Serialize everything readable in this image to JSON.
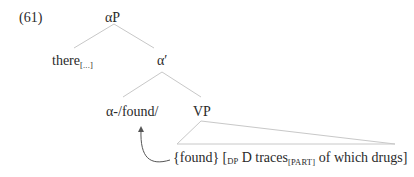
{
  "example_number": "(61)",
  "tree": {
    "root": "αP",
    "spec": {
      "word": "there",
      "subscript": "[...]"
    },
    "bar": "α′",
    "head": "α-/found/",
    "complement": "VP",
    "terminal": {
      "part1": "{found} [",
      "dp_label": "DP",
      "part2": " D traces",
      "traces_subscript": "[PART]",
      "part3": " of which drugs]"
    }
  },
  "colors": {
    "lines": "#c8c8c8",
    "text": "#2a2a2a",
    "arrow": "#555555"
  }
}
